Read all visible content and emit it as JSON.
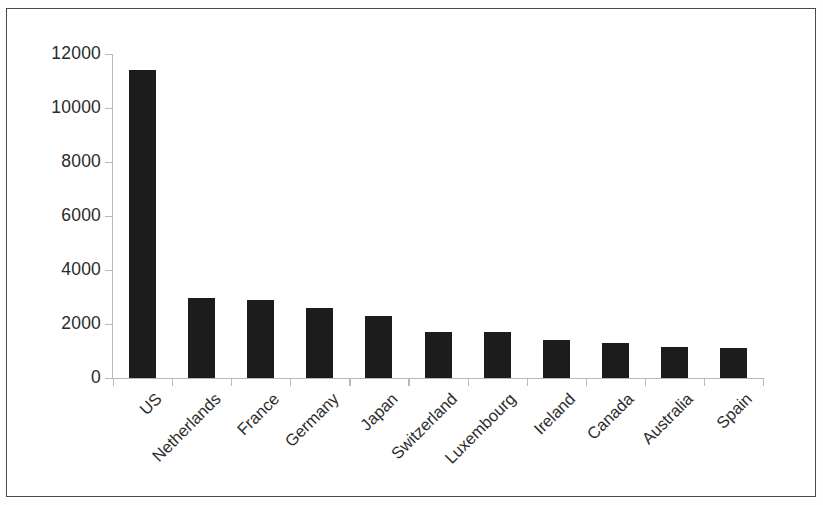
{
  "chart_data": {
    "type": "bar",
    "title": "",
    "subtitle": "",
    "xlabel": "",
    "ylabel": "",
    "categories": [
      "US",
      "Netherlands",
      "France",
      "Germany",
      "Japan",
      "Switzerland",
      "Luxembourg",
      "Ireland",
      "Canada",
      "Australia",
      "Spain"
    ],
    "values": [
      11400,
      2950,
      2900,
      2600,
      2300,
      1700,
      1700,
      1400,
      1300,
      1150,
      1100
    ],
    "ylim": [
      0,
      12000
    ],
    "ytick_labels": [
      "12000",
      "10000",
      "8000",
      "6000",
      "4000",
      "2000",
      "0"
    ],
    "ytick_values": [
      12000,
      10000,
      8000,
      6000,
      4000,
      2000,
      0
    ],
    "grid": false,
    "legend": null,
    "legend_position": "none",
    "bar_color": "#1c1c1c",
    "axis_color": "#b9b9b9",
    "frame_color": "#4a4a4a",
    "xtick_label_rotation": -45
  }
}
